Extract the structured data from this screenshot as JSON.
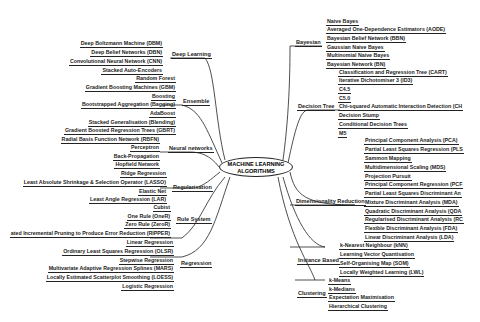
{
  "center": {
    "line1": "MACHINE LEARNING",
    "line2": "ALGORITHMS"
  },
  "left": [
    {
      "category": "Deep Learning",
      "items": [
        "Deep Boltzmann Machine (DBM)",
        "Deep Belief Networks (DBN)",
        "Convolutional Neural Network (CNN)",
        "Stacked Auto-Encoders"
      ]
    },
    {
      "category": "Ensemble",
      "items": [
        "Random Forest",
        "Gradient Boosting Machines (GBM)",
        "Boosting",
        "Bootstrapped Aggregation (Bagging)",
        "AdaBoost",
        "Stacked Generalisation (Blending)",
        "Gradient Boosted Regression Trees (GBRT)"
      ]
    },
    {
      "category": "Neural networks",
      "items": [
        "Radial Basis Function Network (RBFN)",
        "Perceptron",
        "Back-Propagation",
        "Hopfield Network"
      ]
    },
    {
      "category": "Regularisation",
      "items": [
        "Ridge Regression",
        "Least Absolute Shrinkage & Selection Operator (LASSO)",
        "Elastic Net",
        "Least Angle Regression (LAR)"
      ]
    },
    {
      "category": "Rule System",
      "items": [
        "Cubist",
        "One Rule (OneR)",
        "Zero Rule (ZeroR)",
        "ated Incremental Pruning to Produce Error Reduction (RIPPER)"
      ]
    },
    {
      "category": "Regression",
      "items": [
        "Linear Regression",
        "Ordinary Least Squares Regression (OLSR)",
        "Stepwise Regression",
        "Multivariate Adaptive Regression Splines (MARS)",
        "Locally Estimated Scatterplot Smoothing (LOESS)",
        "Logistic Regression"
      ]
    }
  ],
  "right": [
    {
      "category": "Bayesian",
      "items": [
        "Naive Bayes",
        "Averaged One-Dependence Estimators (AODE)",
        "Bayesian Belief Network (BBN)",
        "Gaussian Naive Bayes",
        "Multinomial Naive Bayes",
        "Bayesian Network (BN)"
      ]
    },
    {
      "category": "Decision Tree",
      "items": [
        "Classification and Regression Tree (CART)",
        "Iterative Dichotomiser 3 (ID3)",
        "C4.5",
        "C5.0",
        "Chi-squared Automatic Interaction Detection (CH",
        "Decision Stump",
        "Conditional Decision Trees",
        "M5"
      ]
    },
    {
      "category": "Dimensionality Reduction",
      "items": [
        "Principal Component Analysis (PCA)",
        "Partial Least Squares Regression (PLS",
        "Sammon Mapping",
        "Multidimensional Scaling (MDS)",
        "Projection Pursuit",
        "Principal Component Regression (PCF",
        "Partial Least Squares Discriminant An",
        "Mixture Discriminant Analysis (MDA)",
        "Quadratic Discriminant Analysis (QDA",
        "Regularised Discriminant Analysis (RC",
        "Flexible Discriminant Analysis (FDA)",
        "Linear Discriminant Analysis (LDA)"
      ]
    },
    {
      "category": "Instance Based",
      "items": [
        "k-Nearest Neighbour (kNN)",
        "Learning Vector Quantisation",
        "Self-Organising Map (SOM)",
        "Locally Weighted Learning (LWL)"
      ]
    },
    {
      "category": "Clustering",
      "items": [
        "k-Means",
        "k-Medians",
        "Expectation Maximisation",
        "Hierarchical Clustering"
      ]
    }
  ]
}
